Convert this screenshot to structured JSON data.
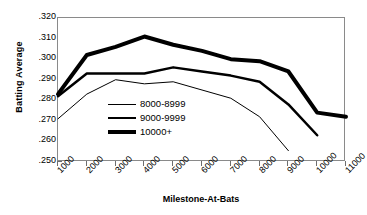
{
  "chart_data": {
    "type": "line",
    "title": "",
    "xlabel": "Milestone-At-Bats",
    "ylabel": "Batting Average",
    "x": [
      1000,
      2000,
      3000,
      4000,
      5000,
      6000,
      7000,
      8000,
      9000,
      10000,
      11000
    ],
    "xtick_labels": [
      "1000",
      "2000",
      "3000",
      "4000",
      "5000",
      "6000",
      "7000",
      "8000",
      "9000",
      "10000",
      "11000"
    ],
    "ytick_labels": [
      ".320",
      ".310",
      ".300",
      ".290",
      ".280",
      ".270",
      ".260",
      ".250"
    ],
    "ytick_values": [
      0.32,
      0.31,
      0.3,
      0.29,
      0.28,
      0.27,
      0.26,
      0.25
    ],
    "xlim": [
      1000,
      11000
    ],
    "ylim": [
      0.25,
      0.32
    ],
    "grid": false,
    "legend_position": "center-left-inside",
    "series": [
      {
        "name": "8000-8999",
        "style": "thin",
        "color": "#000000",
        "line_width": 1,
        "values": [
          0.271,
          0.283,
          0.29,
          0.288,
          0.289,
          0.285,
          0.281,
          0.272,
          0.2555,
          null,
          null
        ]
      },
      {
        "name": "9000-9999",
        "style": "medium",
        "color": "#000000",
        "line_width": 2.5,
        "values": [
          0.282,
          0.293,
          0.293,
          0.293,
          0.296,
          0.294,
          0.292,
          0.289,
          0.278,
          0.263,
          null
        ]
      },
      {
        "name": "10000+",
        "style": "thick",
        "color": "#000000",
        "line_width": 4,
        "values": [
          0.283,
          0.302,
          0.306,
          0.311,
          0.307,
          0.304,
          0.3,
          0.299,
          0.294,
          0.274,
          0.272
        ]
      }
    ]
  },
  "legend": {
    "items": [
      {
        "label": "8000-8999"
      },
      {
        "label": "9000-9999"
      },
      {
        "label": "10000+"
      }
    ]
  },
  "axes": {
    "y_title": "Batting Average",
    "x_title": "Milestone-At-Bats"
  }
}
